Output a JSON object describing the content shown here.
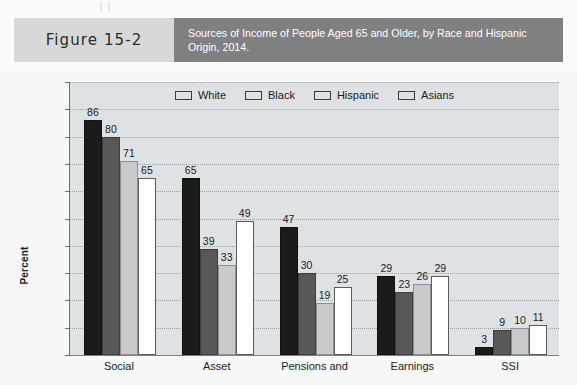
{
  "figure": {
    "number_label": "Figure 15-2",
    "title": "Sources of Income of People Aged 65 and Older, by Race and Hispanic Origin, 2014."
  },
  "colors": {
    "header_number_bg": "#d7d9d8",
    "header_title_bg": "#7e8082",
    "plot_bg": "#dfe2e4",
    "panel_bg": "#f7f8f8",
    "series_white": "#1b1b19",
    "series_black": "#58585a",
    "series_hispanic": "#c9cbcb",
    "series_asians": "#ffffff"
  },
  "chart_data": {
    "type": "bar",
    "title": "Sources of Income of People Aged 65 and Older, by Race and Hispanic Origin, 2014.",
    "xlabel": "",
    "ylabel": "Percent",
    "ylim": [
      0,
      100
    ],
    "ytick_step": 10,
    "yticks": [
      0,
      10,
      20,
      30,
      40,
      50,
      60,
      70,
      80,
      90,
      100
    ],
    "grid": true,
    "legend_position": "top-center",
    "categories": [
      "Social",
      "Asset",
      "Pensions and",
      "Earnings",
      "SSI"
    ],
    "series": [
      {
        "name": "White",
        "values": [
          86,
          65,
          47,
          29,
          3
        ]
      },
      {
        "name": "Black",
        "values": [
          80,
          39,
          30,
          23,
          9
        ]
      },
      {
        "name": "Hispanic",
        "values": [
          71,
          33,
          19,
          26,
          10
        ]
      },
      {
        "name": "Asians",
        "values": [
          65,
          49,
          25,
          29,
          11
        ]
      }
    ],
    "data_labels": true
  }
}
